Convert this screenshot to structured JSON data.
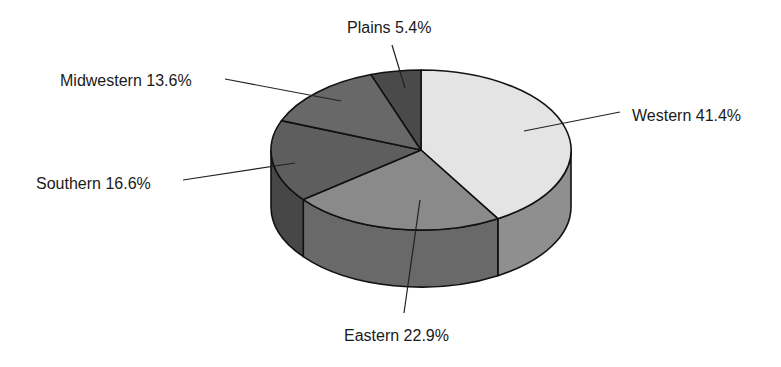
{
  "chart_data": {
    "type": "pie",
    "style": "3d",
    "title": "",
    "slices": [
      {
        "label": "Western",
        "value": 41.4,
        "display": "Western 41.4%",
        "top_color": "#e4e4e4",
        "side_color": "#8f8f8f"
      },
      {
        "label": "Eastern",
        "value": 22.9,
        "display": "Eastern 22.9%",
        "top_color": "#8a8a8a",
        "side_color": "#696969"
      },
      {
        "label": "Southern",
        "value": 16.6,
        "display": "Southern 16.6%",
        "top_color": "#5e5e5e",
        "side_color": "#474747"
      },
      {
        "label": "Midwestern",
        "value": 13.6,
        "display": "Midwestern 13.6%",
        "top_color": "#686868",
        "side_color": "#4f4f4f"
      },
      {
        "label": "Plains",
        "value": 5.4,
        "display": "Plains 5.4%",
        "top_color": "#4a4a4a",
        "side_color": "#383838"
      }
    ],
    "start_angle_deg": -90,
    "direction": "clockwise",
    "legend": "none (leader-line labels)",
    "geometry": {
      "cx": 421,
      "cy": 150,
      "rx": 150,
      "ry": 80,
      "depth": 57
    }
  },
  "labels": {
    "western": "Western 41.4%",
    "eastern": "Eastern 22.9%",
    "southern": "Southern 16.6%",
    "midwestern": "Midwestern 13.6%",
    "plains": "Plains 5.4%"
  }
}
